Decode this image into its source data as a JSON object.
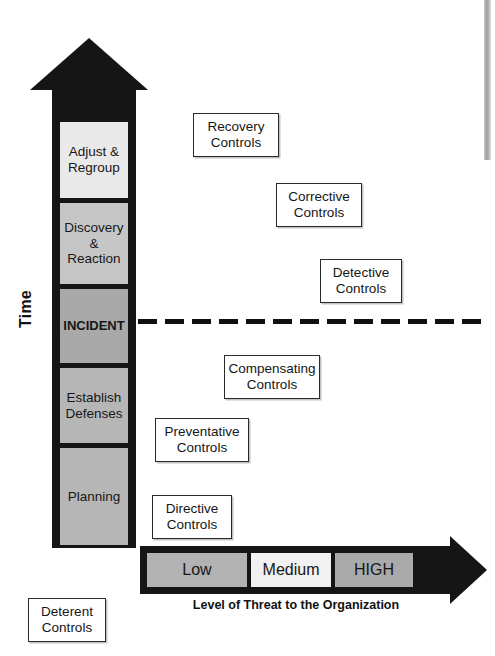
{
  "diagram": {
    "time_axis_label": "Time",
    "threat_axis_caption": "Level of Threat to the Organization",
    "incident_marker": "dashed-line"
  },
  "time_arrow": {
    "direction": "up",
    "color": "#151515",
    "segments": [
      {
        "id": "adjust-regroup",
        "lines": [
          "Adjust &",
          "Regroup"
        ],
        "fill": "#e9e9e9",
        "top": 122,
        "height": 76,
        "bold": false
      },
      {
        "id": "discovery-reaction",
        "lines": [
          "Discovery",
          "& Reaction"
        ],
        "fill": "#c6c6c6",
        "top": 203,
        "height": 81,
        "bold": false
      },
      {
        "id": "incident",
        "lines": [
          "INCIDENT"
        ],
        "fill": "#a9a9a9",
        "top": 289,
        "height": 74,
        "bold": true
      },
      {
        "id": "establish-defenses",
        "lines": [
          "Establish",
          "Defenses"
        ],
        "fill": "#b6b6b6",
        "top": 368,
        "height": 75,
        "bold": false
      },
      {
        "id": "planning",
        "lines": [
          "Planning"
        ],
        "fill": "#b6b6b6",
        "top": 448,
        "height": 97,
        "bold": false
      }
    ]
  },
  "controls": [
    {
      "id": "recovery",
      "lines": [
        "Recovery",
        "Controls"
      ],
      "left": 193,
      "top": 113,
      "width": 86,
      "height": 44
    },
    {
      "id": "corrective",
      "lines": [
        "Corrective",
        "Controls"
      ],
      "left": 276,
      "top": 183,
      "width": 86,
      "height": 44
    },
    {
      "id": "detective",
      "lines": [
        "Detective",
        "Controls"
      ],
      "left": 320,
      "top": 259,
      "width": 82,
      "height": 44
    },
    {
      "id": "compensating",
      "lines": [
        "Compensating",
        "Controls"
      ],
      "left": 224,
      "top": 355,
      "width": 96,
      "height": 44
    },
    {
      "id": "preventative",
      "lines": [
        "Preventative",
        "Controls"
      ],
      "left": 155,
      "top": 418,
      "width": 94,
      "height": 44
    },
    {
      "id": "directive",
      "lines": [
        "Directive",
        "Controls"
      ],
      "left": 152,
      "top": 495,
      "width": 80,
      "height": 44
    },
    {
      "id": "deterent",
      "lines": [
        "Deterent",
        "Controls"
      ],
      "left": 28,
      "top": 598,
      "width": 78,
      "height": 44
    }
  ],
  "threat_arrow": {
    "direction": "right",
    "color": "#151515",
    "caption": "Level of Threat to the Organization",
    "segments": [
      {
        "id": "low",
        "label": "Low",
        "fill": "#b2b2b2",
        "left": 147,
        "width": 100
      },
      {
        "id": "medium",
        "label": "Medium",
        "fill": "#f1f1f1",
        "left": 251,
        "width": 80
      },
      {
        "id": "high",
        "label": "HIGH",
        "fill": "#aaaaaa",
        "left": 335,
        "width": 78
      }
    ]
  },
  "palette": {
    "ink": "#151515",
    "box_border": "#2a2a2a",
    "box_fill": "#ffffff",
    "page": "#ffffff"
  }
}
